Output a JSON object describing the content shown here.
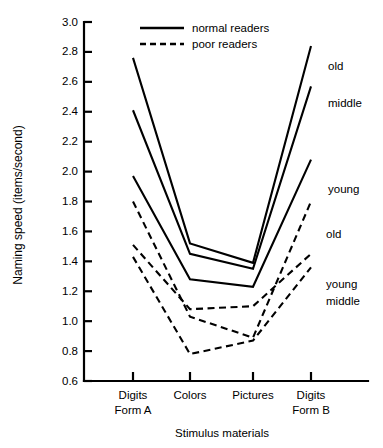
{
  "chart_data": {
    "type": "line",
    "title": "",
    "xlabel": "Stimulus materials",
    "ylabel": "Naming speed (items/second)",
    "categories": [
      "Digits\nForm A",
      "Colors",
      "Pictures",
      "Digits\nForm B"
    ],
    "category_lines": [
      [
        "Digits",
        "Form A"
      ],
      [
        "Colors",
        ""
      ],
      [
        "Pictures",
        ""
      ],
      [
        "Digits",
        "Form B"
      ]
    ],
    "ylim": [
      0.6,
      3.0
    ],
    "yticks": [
      "0.6",
      "0.8",
      "1.0",
      "1.2",
      "1.4",
      "1.6",
      "1.8",
      "2.0",
      "2.2",
      "2.4",
      "2.6",
      "2.8",
      "3.0"
    ],
    "ytick_values": [
      0.6,
      0.8,
      1.0,
      1.2,
      1.4,
      1.6,
      1.8,
      2.0,
      2.2,
      2.4,
      2.6,
      2.8,
      3.0
    ],
    "grid": false,
    "legend_position": "top-center",
    "legend": [
      {
        "label": "normal readers",
        "style": "solid"
      },
      {
        "label": "poor readers",
        "style": "dashed"
      }
    ],
    "series": [
      {
        "name": "old",
        "group": "normal readers",
        "style": "solid",
        "end_label": "old",
        "values": [
          2.76,
          1.52,
          1.39,
          2.84
        ]
      },
      {
        "name": "middle",
        "group": "normal readers",
        "style": "solid",
        "end_label": "middle",
        "values": [
          2.41,
          1.45,
          1.35,
          2.57
        ]
      },
      {
        "name": "young",
        "group": "normal readers",
        "style": "solid",
        "end_label": "young",
        "values": [
          1.97,
          1.28,
          1.23,
          2.08
        ]
      },
      {
        "name": "old",
        "group": "poor readers",
        "style": "dashed",
        "end_label": "old",
        "values": [
          1.8,
          1.03,
          0.89,
          1.8
        ]
      },
      {
        "name": "young",
        "group": "poor readers",
        "style": "dashed",
        "end_label": "young",
        "values": [
          1.51,
          1.08,
          1.1,
          1.45
        ]
      },
      {
        "name": "middle",
        "group": "poor readers",
        "style": "dashed",
        "end_label": "middle",
        "values": [
          1.43,
          0.78,
          0.87,
          1.36
        ]
      }
    ],
    "colors": {
      "ink": "#000000",
      "background": "#ffffff"
    }
  }
}
